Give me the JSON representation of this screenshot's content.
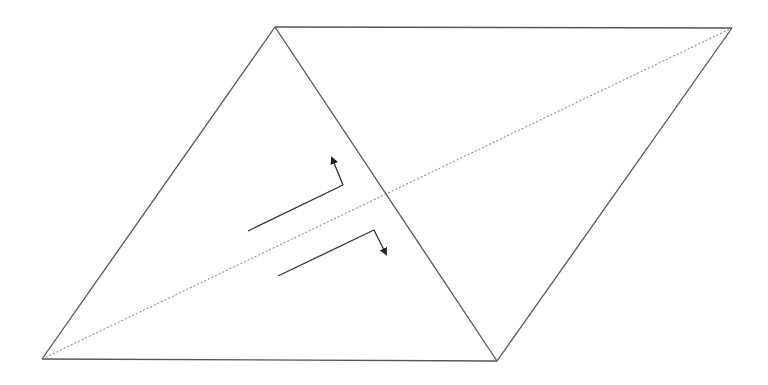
{
  "diagram": {
    "type": "geometric",
    "colors": {
      "background": "#ffffff",
      "edge": "#555555",
      "diagonal": "#777777",
      "arrow": "#333333"
    },
    "vertices": {
      "top_left": [
        275,
        27
      ],
      "top_right": [
        732,
        28
      ],
      "bottom_left": [
        42,
        359
      ],
      "bottom_right": [
        497,
        361
      ]
    },
    "edges": [
      {
        "name": "top-edge",
        "from": "top_left",
        "to": "top_right",
        "style": "solid"
      },
      {
        "name": "right-edge",
        "from": "top_right",
        "to": "bottom_right",
        "style": "solid"
      },
      {
        "name": "bottom-edge",
        "from": "bottom_left",
        "to": "bottom_right",
        "style": "solid"
      },
      {
        "name": "left-edge",
        "from": "bottom_left",
        "to": "top_left",
        "style": "solid"
      },
      {
        "name": "shared-edge",
        "from": "top_left",
        "to": "bottom_right",
        "style": "solid"
      },
      {
        "name": "long-diagonal",
        "from": "bottom_left",
        "to": "top_right",
        "style": "dotted"
      }
    ],
    "arrows": [
      {
        "name": "upper-shear-arrow",
        "points": [
          [
            248,
            231
          ],
          [
            343,
            185
          ],
          [
            332,
            158
          ]
        ],
        "direction": "up"
      },
      {
        "name": "lower-shear-arrow",
        "points": [
          [
            278,
            276
          ],
          [
            374,
            230
          ],
          [
            386,
            254
          ]
        ],
        "direction": "down"
      }
    ]
  }
}
